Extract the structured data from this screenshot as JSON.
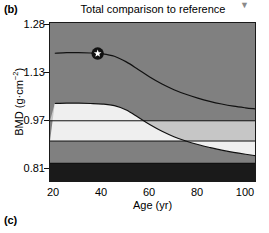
{
  "panels": {
    "b_label": "(b)",
    "c_label": "(c)"
  },
  "header": {
    "title": "Total comparison to reference",
    "title_marker": "▼"
  },
  "chart_data": {
    "type": "area",
    "title": "Total comparison to reference",
    "xlabel": "Age (yr)",
    "ylabel": "BMD (g·cm−2)",
    "ylabel_base": "BMD (g·cm",
    "ylabel_exp": "−2",
    "ylabel_close": ")",
    "xlim": [
      18,
      104
    ],
    "ylim": [
      0.745,
      1.33
    ],
    "grid": false,
    "legend": "none",
    "xticks": [
      20,
      40,
      60,
      80,
      100
    ],
    "xtick_labels": [
      "20",
      "40",
      "60",
      "80",
      "100"
    ],
    "yticks": [
      1.28,
      1.13,
      0.97,
      0.81
    ],
    "ytick_labels": [
      "1.28",
      "1.13",
      "0.97",
      "0.81"
    ],
    "bands": [
      {
        "name": "above-normal",
        "color": "#808080",
        "from": 1.33,
        "to": "upper_curve"
      },
      {
        "name": "normal-band",
        "color": "#808080",
        "from": "upper_curve",
        "to": "mid_line"
      },
      {
        "name": "osteopenia-light",
        "color": "#c6c6c6",
        "from": "mid_line",
        "to": "lower_curve"
      },
      {
        "name": "osteopenia-white",
        "color": "#efefef",
        "from": "lower_curve",
        "to": "low_line"
      },
      {
        "name": "osteoporosis",
        "color": "#808080",
        "from": "low_line",
        "to": 0.81
      },
      {
        "name": "severe",
        "color": "#1a1a1a",
        "from": 0.81,
        "to": 0.745
      }
    ],
    "curves": [
      {
        "name": "upper_reference_curve",
        "color": "#111111",
        "x": [
          20,
          25,
          30,
          35,
          40,
          45,
          50,
          55,
          60,
          65,
          70,
          75,
          80,
          85,
          90,
          95,
          100,
          104
        ],
        "y": [
          1.218,
          1.22,
          1.22,
          1.219,
          1.216,
          1.207,
          1.186,
          1.158,
          1.129,
          1.104,
          1.083,
          1.066,
          1.052,
          1.04,
          1.03,
          1.022,
          1.016,
          1.012
        ]
      },
      {
        "name": "lower_reference_curve",
        "color": "#111111",
        "x": [
          20,
          25,
          30,
          35,
          40,
          45,
          50,
          55,
          60,
          65,
          70,
          75,
          80,
          85,
          90,
          95,
          100,
          104
        ],
        "y": [
          1.032,
          1.033,
          1.033,
          1.032,
          1.03,
          1.024,
          1.008,
          0.981,
          0.953,
          0.929,
          0.909,
          0.893,
          0.88,
          0.869,
          0.859,
          0.851,
          0.844,
          0.839
        ]
      }
    ],
    "horizontal_lines": [
      {
        "name": "mid_line",
        "y": 0.968,
        "color": "#111111"
      },
      {
        "name": "low_line",
        "y": 0.893,
        "color": "#111111"
      },
      {
        "name": "severe_line",
        "y": 0.81,
        "color": "#111111"
      }
    ],
    "markers": [
      {
        "name": "patient-measurement",
        "symbol": "star",
        "x": 38,
        "y": 1.217,
        "fill": "#111111",
        "star_color": "#ffffff"
      }
    ]
  }
}
